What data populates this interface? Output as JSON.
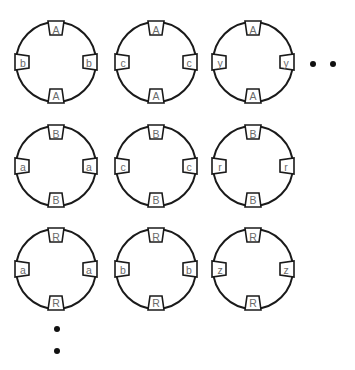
{
  "diagram": {
    "rows": [
      {
        "cy": 62,
        "circles": [
          {
            "cx": 56,
            "top": "A",
            "bottom": "A",
            "left": "b",
            "right": "b"
          },
          {
            "cx": 156,
            "top": "A",
            "bottom": "A",
            "left": "c",
            "right": "c"
          },
          {
            "cx": 253,
            "top": "A",
            "bottom": "A",
            "left": "y",
            "right": "y"
          }
        ]
      },
      {
        "cy": 166,
        "circles": [
          {
            "cx": 56,
            "top": "B",
            "bottom": "B",
            "left": "a",
            "right": "a"
          },
          {
            "cx": 156,
            "top": "B",
            "bottom": "B",
            "left": "c",
            "right": "c"
          },
          {
            "cx": 253,
            "top": "B",
            "bottom": "B",
            "left": "r",
            "right": "r"
          }
        ]
      },
      {
        "cy": 269,
        "circles": [
          {
            "cx": 56,
            "top": "R",
            "bottom": "R",
            "left": "a",
            "right": "a"
          },
          {
            "cx": 156,
            "top": "R",
            "bottom": "R",
            "left": "b",
            "right": "b"
          },
          {
            "cx": 253,
            "top": "R",
            "bottom": "R",
            "left": "z",
            "right": "z"
          }
        ]
      }
    ],
    "radius": 40,
    "ellipsis_horizontal": [
      {
        "x": 313,
        "y": 64
      },
      {
        "x": 333,
        "y": 64
      }
    ],
    "ellipsis_vertical": [
      {
        "x": 57,
        "y": 329
      },
      {
        "x": 57,
        "y": 351
      }
    ],
    "colors": {
      "stroke": "#1a1a1a",
      "label": "#6a6a6a",
      "dot": "#111111"
    }
  }
}
